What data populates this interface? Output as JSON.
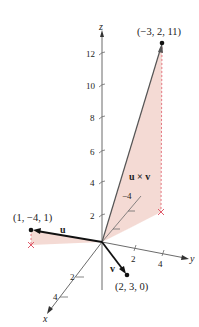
{
  "diagram": {
    "type": "3d-vector-cross-product",
    "axes": {
      "x": {
        "label": "x",
        "ticks": [
          "2",
          "4"
        ]
      },
      "y": {
        "label": "y",
        "ticks": [
          "2",
          "4"
        ]
      },
      "z": {
        "label": "z",
        "ticks": [
          "2",
          "4",
          "6",
          "8",
          "10",
          "12"
        ]
      }
    },
    "vectors": [
      {
        "name": "u",
        "label": "u",
        "point_label": "(1, −4, 1)"
      },
      {
        "name": "v",
        "label": "v",
        "point_label": "(2, 3, 0)"
      },
      {
        "name": "u_cross_v",
        "label": "u × v",
        "point_label": "(−3, 2, 11)"
      }
    ],
    "inner_tick_label": "−4",
    "colors": {
      "axis": "#6b6b6b",
      "vector": "#111111",
      "shade": "#f2d3cc",
      "dashed": "#e05a6a"
    }
  }
}
